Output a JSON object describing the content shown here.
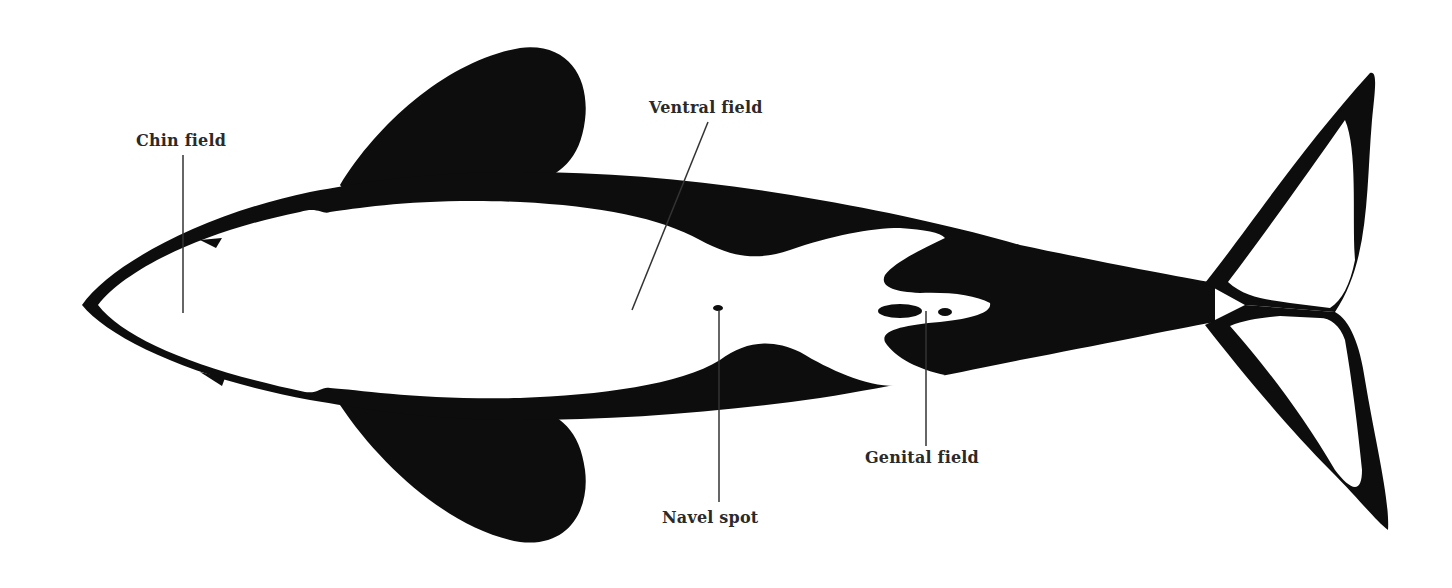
{
  "diagram": {
    "colors": {
      "black": "#0d0d0d",
      "white": "#ffffff",
      "label_text": "#2a2a2a",
      "leader_line": "#333333"
    },
    "labels": [
      {
        "id": "chin",
        "text": "Chin field",
        "x": 136,
        "y": 131
      },
      {
        "id": "ventral",
        "text": "Ventral field",
        "x": 649,
        "y": 98
      },
      {
        "id": "navel",
        "text": "Navel spot",
        "x": 662,
        "y": 508
      },
      {
        "id": "genital",
        "text": "Genital field",
        "x": 865,
        "y": 448
      }
    ]
  }
}
